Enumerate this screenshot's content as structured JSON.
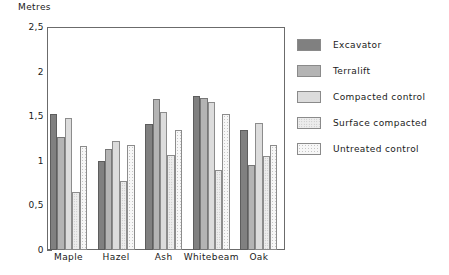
{
  "chart_data": {
    "type": "bar",
    "title": "",
    "xlabel": "",
    "ylabel": "Metres",
    "ylim": [
      0,
      2.5
    ],
    "ytick_labels": [
      "0",
      "0,5",
      "1",
      "1,5",
      "2",
      "2,5"
    ],
    "ytick_values": [
      0,
      0.5,
      1,
      1.5,
      2,
      2.5
    ],
    "yminor_values": [
      0.25,
      0.75,
      1.25,
      1.75,
      2.25
    ],
    "grid": false,
    "legend_position": "right",
    "categories": [
      "Maple",
      "Hazel",
      "Ash",
      "Whitebeam",
      "Oak"
    ],
    "series": [
      {
        "name": "Excavator",
        "color": "#808080",
        "values": [
          1.53,
          1.0,
          1.41,
          1.73,
          1.35
        ]
      },
      {
        "name": "Terralift",
        "color": "#b4b4b4",
        "values": [
          1.27,
          1.13,
          1.69,
          1.7,
          0.95
        ]
      },
      {
        "name": "Compacted control",
        "color": "#dcdcdc",
        "values": [
          1.48,
          1.22,
          1.55,
          1.66,
          1.42
        ]
      },
      {
        "name": "Surface compacted",
        "color": "#ededed",
        "values": [
          0.65,
          0.77,
          1.07,
          0.9,
          1.05
        ]
      },
      {
        "name": "Untreated control",
        "color": "#f7f7f7",
        "values": [
          1.17,
          1.18,
          1.35,
          1.53,
          1.18
        ]
      }
    ]
  },
  "legend": {
    "items": [
      {
        "label": "Excavator"
      },
      {
        "label": "Terralift"
      },
      {
        "label": "Compacted control"
      },
      {
        "label": "Surface compacted"
      },
      {
        "label": "Untreated control"
      }
    ]
  },
  "axis": {
    "y_title": "Metres"
  }
}
